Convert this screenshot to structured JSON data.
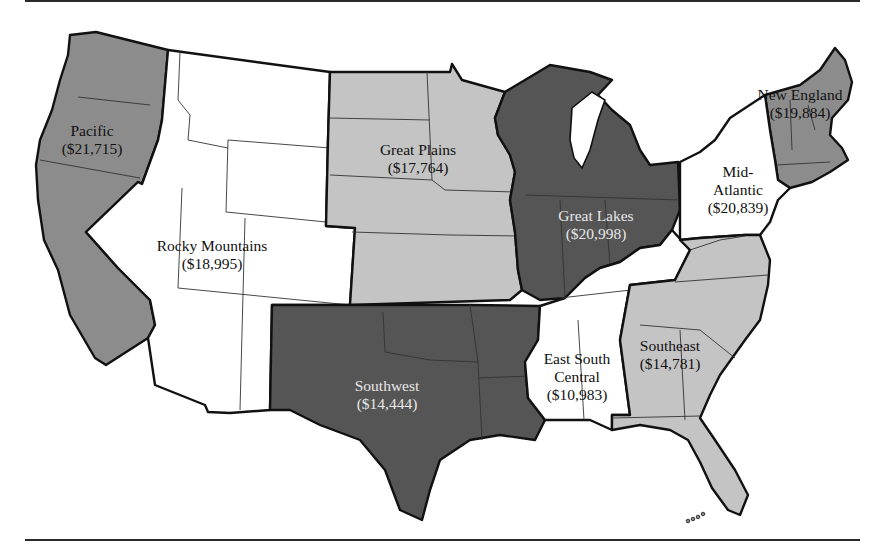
{
  "colors": {
    "light": "#c4c4c4",
    "medium": "#8c8c8c",
    "dark": "#555555",
    "none": "#ffffff",
    "border": "#111111"
  },
  "regions": [
    {
      "id": "pacific",
      "name": "Pacific",
      "value": "($21,715)",
      "shade": "medium"
    },
    {
      "id": "rocky-mountains",
      "name": "Rocky Mountains",
      "value": "($18,995)",
      "shade": "none"
    },
    {
      "id": "great-plains",
      "name": "Great Plains",
      "value": "($17,764)",
      "shade": "light"
    },
    {
      "id": "great-lakes",
      "name": "Great Lakes",
      "value": "($20,998)",
      "shade": "dark"
    },
    {
      "id": "new-england",
      "name": "New England",
      "value": "($19,884)",
      "shade": "medium"
    },
    {
      "id": "mid-atlantic",
      "name": "Mid-Atlantic",
      "name_line1": "Mid-",
      "name_line2": "Atlantic",
      "value": "($20,839)",
      "shade": "none"
    },
    {
      "id": "southwest",
      "name": "Southwest",
      "value": "($14,444)",
      "shade": "dark"
    },
    {
      "id": "east-south-central",
      "name": "East South Central",
      "name_line1": "East South",
      "name_line2": "Central",
      "value": "($10,983)",
      "shade": "none"
    },
    {
      "id": "southeast",
      "name": "Southeast",
      "value": "($14,781)",
      "shade": "light"
    }
  ]
}
